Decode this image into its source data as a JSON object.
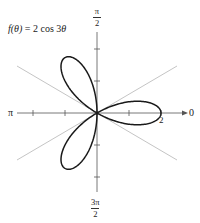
{
  "figure": {
    "equation_label": {
      "func": "f(θ)",
      "eq": " = 2 cos 3",
      "var": "θ"
    },
    "axis_labels": {
      "top": {
        "num": "π",
        "den": "2"
      },
      "bottom": {
        "num": "3π",
        "den": "2"
      },
      "left": "π",
      "right": "0"
    },
    "tick_label_r": "2",
    "colors": {
      "curve": "#1a1a1a",
      "axis": "#555555",
      "guide": "#bdbdbd"
    }
  },
  "chart_data": {
    "type": "polar_curve",
    "title": "f(θ) = 2 cos 3θ",
    "function": "r = 2*cos(3*theta)",
    "petals": 3,
    "max_r": 2,
    "petal_directions": [
      "0",
      "2π/3",
      "4π/3"
    ],
    "guide_lines_deg": [
      30,
      150
    ],
    "radial_ticks": [
      1,
      2
    ],
    "angle_labels": {
      "0": "0",
      "90": "π/2",
      "180": "π",
      "270": "3π/2"
    },
    "r_tick_labeled": 2
  }
}
